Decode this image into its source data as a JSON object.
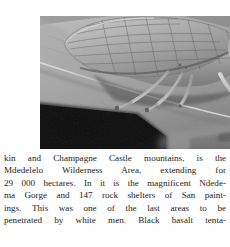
{
  "page": {
    "width": 230,
    "height": 247,
    "background_color": "#ffffff"
  },
  "figure": {
    "kind": "photograph",
    "rendering": "black-and-white halftone photograph",
    "palette": {
      "leaf_light": "#b9b9b9",
      "leaf_mid": "#9a9a9a",
      "leaf_dark": "#6f6f6f",
      "insect_body": "#a5a5a5",
      "insect_highlight": "#cfcfcf",
      "wing_vein": "#6a6a6a",
      "shadow_black": "#0a0a0a",
      "background_blur": "#8a8a8a"
    },
    "bounds": {
      "x": 0,
      "y": 0,
      "width": 230,
      "height": 133
    }
  },
  "text": {
    "justified": true,
    "color": "#1c1c1c",
    "lines": [
      {
        "id": "line-1",
        "full": "kin and Champagne Castle mountains, is the",
        "words": [
          "kin",
          "and",
          "Champagne",
          "Castle",
          "mountains,",
          "is",
          "the"
        ]
      },
      {
        "id": "line-2",
        "full": "Mdedelelo Wilderness Area, extending for",
        "words": [
          "Mdedelelo",
          "Wilderness",
          "Area,",
          "extending",
          "for"
        ]
      },
      {
        "id": "line-3",
        "full": "29 000 hectares. In it is the magnificent Ndede-",
        "words": [
          "29 000",
          "hectares.",
          "In",
          "it",
          "is",
          "the",
          "magnificent",
          "Ndede-"
        ]
      },
      {
        "id": "line-4",
        "full": "ma Gorge and 147 rock shelters of San paint-",
        "words": [
          "ma",
          "Gorge",
          "and",
          "147",
          "rock",
          "shelters",
          "of",
          "San",
          "paint-"
        ]
      },
      {
        "id": "line-5",
        "full": "ings. This was one of the last areas to be",
        "words": [
          "ings.",
          "This",
          "was",
          "one",
          "of",
          "the",
          "last",
          "areas",
          "to",
          "be"
        ]
      },
      {
        "id": "line-6",
        "full": "penetrated by white men. Black basalt tenta-",
        "words": [
          "penetrated",
          "by",
          "white",
          "men.",
          "Black",
          "basalt",
          "tenta-"
        ]
      }
    ]
  }
}
